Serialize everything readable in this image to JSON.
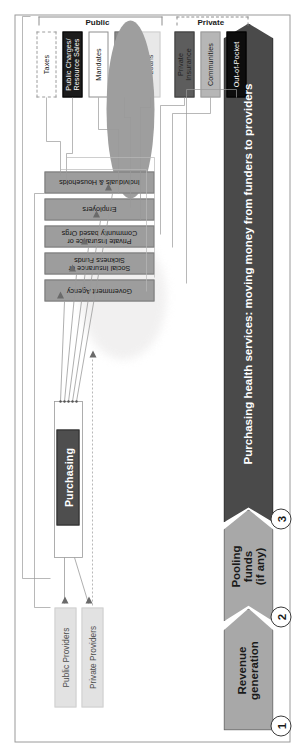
{
  "figure": {
    "orientation": "landscape diagram rotated 90 degrees in a portrait page"
  },
  "stages": [
    {
      "number": "1",
      "label": "Revenue\ngeneration",
      "label_line1": "Revenue",
      "label_line2": "generation",
      "fill": "#a8a8a8"
    },
    {
      "number": "2",
      "label": "Pooling funds (if any)",
      "label_line1": "Pooling",
      "label_line2": "funds",
      "label_line3": "(if any)",
      "fill": "#a8a8a8"
    },
    {
      "number": "3",
      "label": "Purchasing health services: moving money from funders to providers",
      "fill": "#4a4a4a",
      "text_color": "#ffffff"
    }
  ],
  "revenue_sources": {
    "public_group_label": "Public",
    "private_group_label": "Private",
    "items": [
      {
        "label": "Taxes",
        "fill": "#ffffff",
        "text_color": "#1a1a1a",
        "border": "dashed",
        "group": "Public"
      },
      {
        "label": "Public Charges/ Resource Sales",
        "label_line1": "Public Charges/",
        "label_line2": "Resource Sales",
        "fill": "#1c1c1c",
        "text_color": "#ffffff",
        "border": "solid",
        "group": "Public"
      },
      {
        "label": "Mandates",
        "fill": "#ffffff",
        "text_color": "#1a1a1a",
        "border": "solid",
        "group": "Public"
      },
      {
        "label": "Grants",
        "fill": "#8c8c8c",
        "text_color": "#1a1a1a",
        "border": "solid",
        "group": "Public"
      },
      {
        "label": "Loans",
        "fill": "#e8e8e8",
        "text_color": "#3a3a3a",
        "border": "solid",
        "group": "Public"
      },
      {
        "label": "Private Insurance",
        "label_line1": "Private",
        "label_line2": "Insurance",
        "fill": "#5d5d5d",
        "text_color": "#1a1a1a",
        "border": "solid",
        "group": "Private"
      },
      {
        "label": "Communities",
        "fill": "#b6b6b6",
        "text_color": "#1a1a1a",
        "border": "solid",
        "group": "Private"
      },
      {
        "label": "Out-of-Pocket",
        "fill": "#0d0d0d",
        "text_color": "#ffffff",
        "border": "solid",
        "group": "Private"
      }
    ]
  },
  "pooling": {
    "shape_label": "",
    "fill": "#9e9e9e"
  },
  "funders": [
    {
      "label": "Government Agency",
      "label_line1": "Government Agency",
      "fill": "#9d9d9d"
    },
    {
      "label": "Social Insurance or Sickness Funds",
      "label_line1": "Social Insurance or",
      "label_line2": "Sickness Funds",
      "fill": "#9d9d9d"
    },
    {
      "label": "Private Insurance or Community based Orgs",
      "label_line1": "Private Insurance or",
      "label_line2": "Community based Orgs",
      "fill": "#9d9d9d"
    },
    {
      "label": "Employers",
      "label_line1": "Employers",
      "fill": "#9d9d9d"
    },
    {
      "label": "Individuals & Households",
      "label_line1": "Individuals & Households",
      "fill": "#9d9d9d"
    }
  ],
  "purchasing": {
    "label": "Purchasing",
    "fill": "#4e4e4e",
    "text_color": "#ffffff"
  },
  "providers": [
    {
      "label": "Public Providers",
      "fill": "#e2e2e2"
    },
    {
      "label": "Private Providers",
      "fill": "#e2e2e2"
    }
  ],
  "colors": {
    "frame_border": "#9a9a9a",
    "connector": "#8f8f8f",
    "connector_light": "#bdbdbd",
    "stage_gray": "#a8a8a8",
    "stage_dark": "#4a4a4a"
  }
}
